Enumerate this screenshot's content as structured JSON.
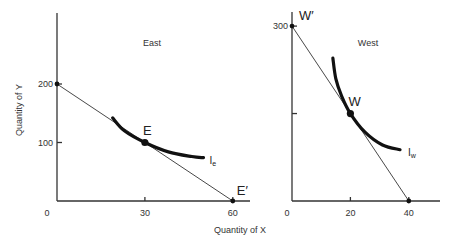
{
  "chart_data": [
    {
      "type": "line",
      "title": "East",
      "xlabel": "Quantity of X",
      "ylabel": "Quantity of Y",
      "xlim": [
        0,
        65
      ],
      "ylim": [
        0,
        345
      ],
      "x_ticks": [
        0,
        30,
        60
      ],
      "y_ticks": [
        100,
        200
      ],
      "budget_line": {
        "name": "Budget line",
        "points": [
          [
            0,
            200
          ],
          [
            60,
            0
          ]
        ]
      },
      "indifference_curve": {
        "name": "Ie",
        "label_main": "I",
        "label_sub": "e",
        "points": [
          [
            19,
            142
          ],
          [
            23,
            120
          ],
          [
            30,
            100
          ],
          [
            38,
            84
          ],
          [
            46,
            76
          ],
          [
            50,
            74
          ]
        ]
      },
      "points": [
        {
          "label": "",
          "x": 0,
          "y": 200
        },
        {
          "label": "E",
          "x": 30,
          "y": 100
        },
        {
          "label": "E′",
          "x": 60,
          "y": 0
        }
      ],
      "grid": false
    },
    {
      "type": "line",
      "title": "West",
      "xlabel": "",
      "ylabel": "",
      "xlim": [
        0,
        51
      ],
      "ylim": [
        0,
        325
      ],
      "x_ticks": [
        0,
        20,
        40
      ],
      "y_ticks": [
        150,
        300
      ],
      "y_tick_labels": [
        "",
        "300"
      ],
      "budget_line": {
        "name": "Budget line",
        "points": [
          [
            0,
            300
          ],
          [
            40,
            0
          ]
        ]
      },
      "indifference_curve": {
        "name": "Iw",
        "label_main": "I",
        "label_sub": "w",
        "points": [
          [
            14,
            245
          ],
          [
            15,
            210
          ],
          [
            17,
            180
          ],
          [
            20,
            150
          ],
          [
            25,
            118
          ],
          [
            31,
            96
          ],
          [
            37,
            88
          ]
        ]
      },
      "points": [
        {
          "label": "W′",
          "x": 0,
          "y": 300
        },
        {
          "label": "W",
          "x": 20,
          "y": 150
        },
        {
          "label": "",
          "x": 40,
          "y": 0
        }
      ],
      "grid": false
    }
  ]
}
